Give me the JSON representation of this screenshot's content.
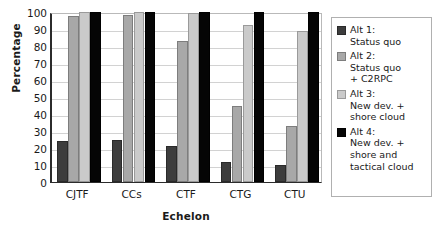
{
  "chart_data": {
    "type": "bar",
    "title": "",
    "xlabel": "Echelon",
    "ylabel": "Percentage",
    "categories": [
      "CJTF",
      "CCs",
      "CTF",
      "CTG",
      "CTU"
    ],
    "ylim": [
      0,
      100
    ],
    "yticks": [
      0,
      10,
      20,
      30,
      40,
      50,
      60,
      70,
      80,
      90,
      100
    ],
    "grid": true,
    "legend_position": "right",
    "series": [
      {
        "name": "Alt 1:\nStatus quo",
        "short_name": "Alt 1",
        "color": "#3d3d3d",
        "values": [
          24,
          24.5,
          21,
          12,
          10
        ]
      },
      {
        "name": "Alt 2:\nStatus quo\n+ C2RPC",
        "short_name": "Alt 2",
        "color": "#a8a8a8",
        "values": [
          97.5,
          98,
          83,
          45,
          33
        ]
      },
      {
        "name": "Alt 3:\nNew dev. +\nshore cloud",
        "short_name": "Alt 3",
        "color": "#cacaca",
        "values": [
          100,
          100,
          99.5,
          92.5,
          89
        ]
      },
      {
        "name": "Alt 4:\nNew dev. +\nshore and\ntactical cloud",
        "short_name": "Alt 4",
        "color": "#050505",
        "values": [
          100,
          100,
          100,
          100,
          100
        ]
      }
    ]
  }
}
